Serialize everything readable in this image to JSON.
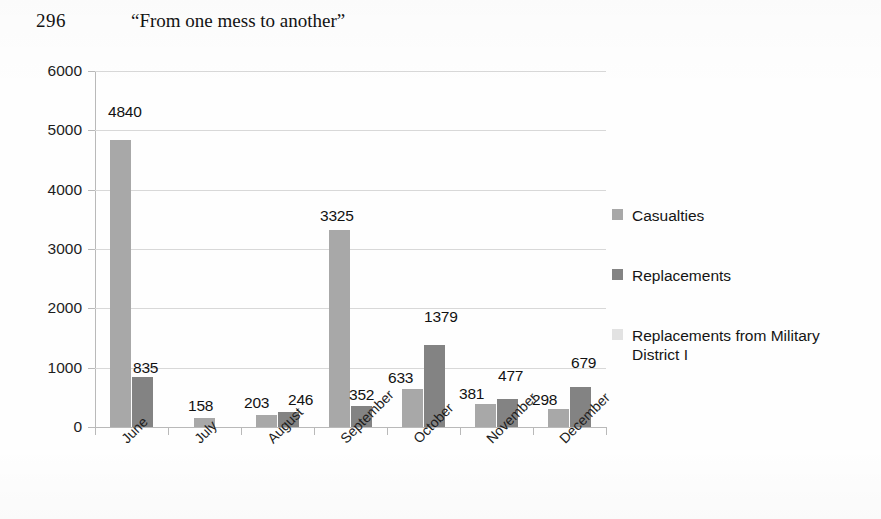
{
  "page": {
    "folio": "296",
    "running_head": "“From one mess to another”"
  },
  "chart_data": {
    "type": "bar",
    "title": "",
    "xlabel": "",
    "ylabel": "",
    "ylim": [
      0,
      6000
    ],
    "ytick_step": 1000,
    "yticks": [
      "6000",
      "5000",
      "4000",
      "3000",
      "2000",
      "1000",
      "0"
    ],
    "grid": true,
    "legend_position": "right",
    "categories": [
      "June",
      "July",
      "August",
      "September",
      "October",
      "November",
      "December"
    ],
    "series": [
      {
        "name": "Casualties",
        "color": "#a8a8a8",
        "values": [
          4840,
          158,
          203,
          3325,
          633,
          381,
          298
        ]
      },
      {
        "name": "Replacements",
        "color": "#838383",
        "values": [
          835,
          0,
          246,
          352,
          1379,
          477,
          679
        ]
      },
      {
        "name": "Replacements from Military District I",
        "color": "#dedede",
        "values": [
          0,
          0,
          0,
          0,
          0,
          0,
          0
        ]
      }
    ],
    "data_labels": [
      {
        "text": "4840",
        "series": "Casualties",
        "category": "June"
      },
      {
        "text": "835",
        "series": "Replacements",
        "category": "June"
      },
      {
        "text": "158",
        "series": "Casualties",
        "category": "July"
      },
      {
        "text": "203",
        "series": "Casualties",
        "category": "August"
      },
      {
        "text": "246",
        "series": "Replacements",
        "category": "August"
      },
      {
        "text": "3325",
        "series": "Casualties",
        "category": "September"
      },
      {
        "text": "352",
        "series": "Replacements",
        "category": "September"
      },
      {
        "text": "633",
        "series": "Casualties",
        "category": "October"
      },
      {
        "text": "1379",
        "series": "Replacements",
        "category": "October"
      },
      {
        "text": "381",
        "series": "Casualties",
        "category": "November"
      },
      {
        "text": "477",
        "series": "Replacements",
        "category": "November"
      },
      {
        "text": "298",
        "series": "Casualties",
        "category": "December"
      },
      {
        "text": "679",
        "series": "Replacements",
        "category": "December"
      }
    ]
  }
}
